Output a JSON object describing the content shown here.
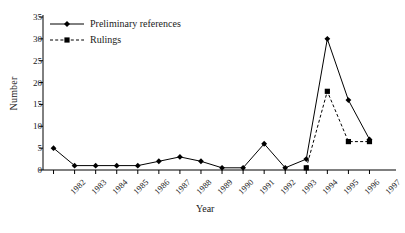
{
  "chart_data": {
    "type": "line",
    "title": "",
    "xlabel": "Year",
    "ylabel": "Number",
    "categories": [
      "1982",
      "1983",
      "1984",
      "1985",
      "1986",
      "1987",
      "1988",
      "1989",
      "1990",
      "1991",
      "1992",
      "1993",
      "1994",
      "1995",
      "1996",
      "1997"
    ],
    "ylim": [
      0,
      35
    ],
    "yticks": [
      0,
      5,
      10,
      15,
      20,
      25,
      30,
      35
    ],
    "grid": false,
    "legend_position": "top-left",
    "series": [
      {
        "name": "Preliminary references",
        "style": "solid",
        "marker": "diamond",
        "color": "#000000",
        "values": [
          5,
          1,
          1,
          1,
          1,
          2,
          3,
          2,
          0.5,
          0.5,
          6,
          0.5,
          2.5,
          30,
          16,
          7
        ]
      },
      {
        "name": "Rulings",
        "style": "dashed",
        "marker": "square",
        "color": "#000000",
        "values": [
          null,
          null,
          null,
          null,
          null,
          null,
          null,
          null,
          null,
          null,
          null,
          null,
          0.5,
          18,
          6.5,
          6.5
        ]
      }
    ]
  }
}
